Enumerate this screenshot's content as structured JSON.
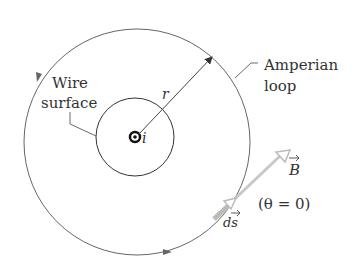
{
  "diagram": {
    "labels": {
      "wire_surface_line1": "Wire",
      "wire_surface_line2": "surface",
      "amperian_line1": "Amperian",
      "amperian_line2": "loop",
      "radius": "r",
      "current": "i",
      "field": "B",
      "element": "ds",
      "angle": "(θ = 0)"
    },
    "colors": {
      "line": "#555555",
      "vector": "#c8c8c8",
      "text": "#333333"
    }
  }
}
